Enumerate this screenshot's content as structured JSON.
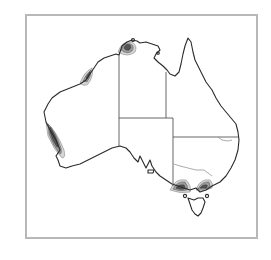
{
  "figure": {
    "frame_color": "#b8b8b8",
    "coast_color": "#2a2a2a",
    "contour_levels": [
      "#d6d6d6",
      "#9a9a9a",
      "#555555"
    ],
    "hotspots": [
      {
        "name": "top-end-north",
        "label_visible": false
      },
      {
        "name": "kimberley-coast",
        "label_visible": false
      },
      {
        "name": "south-west-wa",
        "label_visible": false
      },
      {
        "name": "western-victoria",
        "label_visible": false
      },
      {
        "name": "eastern-victoria",
        "label_visible": false
      }
    ]
  }
}
